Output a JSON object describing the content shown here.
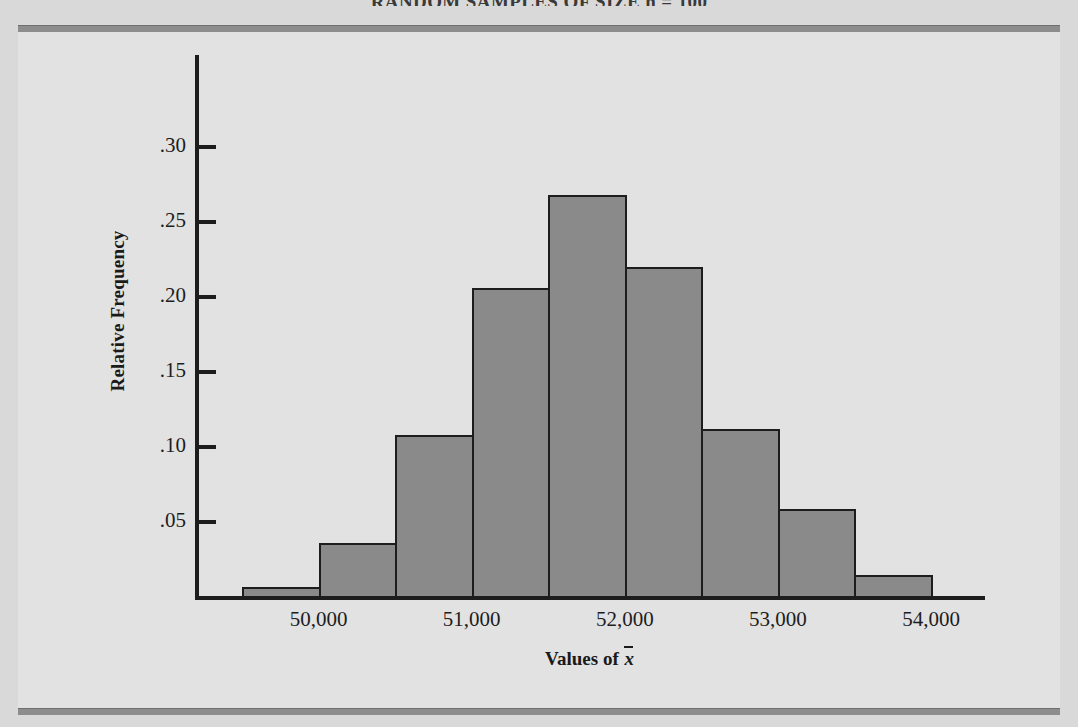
{
  "page": {
    "title": "RANDOM SAMPLES OF SIZE n = 100",
    "background_color": "#d9d9d9",
    "panel_color": "#e2e2e2",
    "rule_color": "#8d8d8d"
  },
  "chart_data": {
    "type": "bar",
    "title": "",
    "xlabel": "Values of x̄",
    "ylabel": "Relative Frequency",
    "bar_color": "#8a8a8a",
    "bar_edge_color": "#1d1d1d",
    "grid": false,
    "legend": "none",
    "xlim": [
      49500,
      54350
    ],
    "ylim": [
      0,
      0.32
    ],
    "x_tick_labels": [
      "50,000",
      "51,000",
      "52,000",
      "53,000",
      "54,000"
    ],
    "x_tick_values": [
      50000,
      51000,
      52000,
      53000,
      54000
    ],
    "y_tick_labels": [
      ".05",
      ".10",
      ".15",
      ".20",
      ".25",
      ".30"
    ],
    "y_tick_values": [
      0.05,
      0.1,
      0.15,
      0.2,
      0.25,
      0.3
    ],
    "bin_edges": [
      49500,
      50000,
      50500,
      51000,
      51500,
      52000,
      52500,
      53000,
      53500,
      54000
    ],
    "categories": [
      "49,500-50,000",
      "50,000-50,500",
      "50,500-51,000",
      "51,000-51,500",
      "51,500-52,000",
      "52,000-52,500",
      "52,500-53,000",
      "53,000-53,500",
      "53,500-54,000"
    ],
    "values": [
      0.007,
      0.036,
      0.108,
      0.206,
      0.268,
      0.22,
      0.112,
      0.059,
      0.015
    ]
  }
}
